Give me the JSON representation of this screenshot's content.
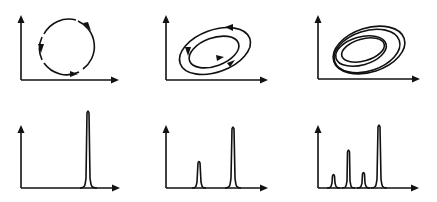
{
  "figure": {
    "panels": [
      {
        "row": 1,
        "col": 1,
        "kind": "phase-portrait",
        "label": "limit cycle (single loop)",
        "loops": 1
      },
      {
        "row": 1,
        "col": 2,
        "kind": "phase-portrait",
        "label": "period-2 orbit (double loop)",
        "loops": 2
      },
      {
        "row": 1,
        "col": 3,
        "kind": "phase-portrait",
        "label": "period-4 orbit (multiple loops)",
        "loops": 4
      },
      {
        "row": 2,
        "col": 1,
        "kind": "spectrum",
        "label": "single peak",
        "peaks": [
          {
            "x": 0.67,
            "h": 1.0
          }
        ]
      },
      {
        "row": 2,
        "col": 2,
        "kind": "spectrum",
        "label": "fundamental + subharmonic",
        "peaks": [
          {
            "x": 0.33,
            "h": 0.44
          },
          {
            "x": 0.67,
            "h": 1.0
          }
        ]
      },
      {
        "row": 2,
        "col": 3,
        "kind": "spectrum",
        "label": "period-doubled peaks",
        "peaks": [
          {
            "x": 0.17,
            "h": 0.2
          },
          {
            "x": 0.33,
            "h": 0.6
          },
          {
            "x": 0.5,
            "h": 0.27
          },
          {
            "x": 0.67,
            "h": 1.0
          }
        ]
      }
    ],
    "colors": {
      "line": "#111111",
      "background": "#ffffff"
    }
  }
}
